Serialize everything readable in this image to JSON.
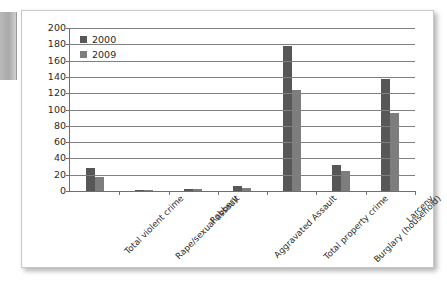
{
  "chart_data": {
    "type": "bar",
    "title": "",
    "subtitle": "",
    "xlabel": "",
    "ylabel": "",
    "ylim": [
      0,
      200
    ],
    "ytick_step": 20,
    "yticks": [
      "200",
      "180",
      "160",
      "140",
      "120",
      "100",
      "80",
      "60",
      "40",
      "20",
      "0"
    ],
    "grid": true,
    "legend_position": "top-left-inside",
    "categories": [
      "Total violent crime",
      "Rape/sexual assault",
      "Robbery",
      "Aggravated Assault",
      "Total property crime",
      "Burglary (household)",
      "Larceny"
    ],
    "series": [
      {
        "name": "2000",
        "color": "#575757",
        "values": [
          28,
          1,
          3,
          6,
          178,
          32,
          137
        ]
      },
      {
        "name": "2009",
        "color": "#7d7d7d",
        "values": [
          17,
          1,
          2,
          4,
          124,
          24,
          96
        ]
      }
    ]
  },
  "legend": {
    "items": [
      {
        "label": "2000",
        "color": "#575757"
      },
      {
        "label": "2009",
        "color": "#7d7d7d"
      }
    ]
  },
  "colors": {
    "series_2000": "#575757",
    "series_2009": "#7d7d7d",
    "axis": "#6f6f6f",
    "gridline": "#808080",
    "card_background": "#ffffff",
    "card_border": "#c8c8c8",
    "page_background": "#ffffff",
    "side_tab": "#a9a9a9"
  }
}
